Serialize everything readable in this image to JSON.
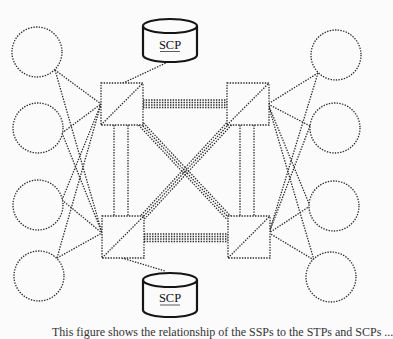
{
  "diagram": {
    "type": "network-topology",
    "colors": {
      "line": "#2a2a2a",
      "background": "#fbfbfb",
      "cylinder_stroke": "#151515"
    },
    "databases": [
      {
        "id": "scp-top",
        "label": "SCP",
        "x": 170,
        "y_top": 17,
        "width": 54,
        "height": 44,
        "attached_to": "stp-top-left"
      },
      {
        "id": "scp-bottom",
        "label": "SCP",
        "x": 170,
        "y_top": 272,
        "width": 54,
        "height": 46,
        "attached_to": "stp-bottom-left"
      }
    ],
    "transfer_points": [
      {
        "id": "stp-top-left",
        "x": 101,
        "y": 83,
        "size": 42
      },
      {
        "id": "stp-top-right",
        "x": 227,
        "y": 83,
        "size": 42
      },
      {
        "id": "stp-bottom-left",
        "x": 102,
        "y": 216,
        "size": 42
      },
      {
        "id": "stp-bottom-right",
        "x": 228,
        "y": 216,
        "size": 42
      }
    ],
    "end_nodes_left": [
      {
        "id": "node-l1",
        "cx": 37,
        "cy": 52,
        "r": 25
      },
      {
        "id": "node-l2",
        "cx": 38,
        "cy": 128,
        "r": 25
      },
      {
        "id": "node-l3",
        "cx": 38,
        "cy": 205,
        "r": 25
      },
      {
        "id": "node-l4",
        "cx": 39,
        "cy": 276,
        "r": 25
      }
    ],
    "end_nodes_right": [
      {
        "id": "node-r1",
        "cx": 336,
        "cy": 55,
        "r": 25
      },
      {
        "id": "node-r2",
        "cx": 335,
        "cy": 128,
        "r": 25
      },
      {
        "id": "node-r3",
        "cx": 334,
        "cy": 206,
        "r": 25
      },
      {
        "id": "node-r4",
        "cx": 331,
        "cy": 277,
        "r": 25
      }
    ],
    "links": {
      "access": "each end node links to both STPs of its mated pair",
      "bridge": "quad links between left and right STP pairs (horizontal)",
      "cross": "diagonal quad links between opposite STPs",
      "mate": "double links between STPs in same pair (vertical)"
    }
  },
  "caption": {
    "text": "This figure shows the relationship of the SSPs to the STPs and SCPs ...",
    "clipped": true
  }
}
